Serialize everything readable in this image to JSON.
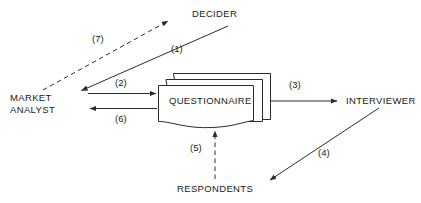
{
  "diagram": {
    "stroke_color": "#2b2b2b",
    "text_color": "#1a1a1a",
    "background_color": "#ffffff",
    "nodes": {
      "decider": {
        "label": "DECIDER"
      },
      "market_analyst": {
        "label": "MARKET\nANALYST",
        "line1": "MARKET",
        "line2": "ANALYST"
      },
      "questionnaire": {
        "label": "QUESTIONNAIRE"
      },
      "interviewer": {
        "label": "INTERVIEWER"
      },
      "respondents": {
        "label": "RESPONDENTS"
      }
    },
    "edges": [
      {
        "id": "1",
        "label": "(1)",
        "from": "decider",
        "to": "market_analyst",
        "style": "solid",
        "direction": "down-left"
      },
      {
        "id": "2",
        "label": "(2)",
        "from": "market_analyst",
        "to": "questionnaire",
        "style": "solid",
        "direction": "right"
      },
      {
        "id": "3",
        "label": "(3)",
        "from": "questionnaire",
        "to": "interviewer",
        "style": "solid",
        "direction": "right"
      },
      {
        "id": "4",
        "label": "(4)",
        "from": "interviewer",
        "to": "respondents",
        "style": "solid",
        "direction": "down-left"
      },
      {
        "id": "5",
        "label": "(5)",
        "from": "respondents",
        "to": "questionnaire",
        "style": "dashed",
        "direction": "up"
      },
      {
        "id": "6",
        "label": "(6)",
        "from": "questionnaire",
        "to": "market_analyst",
        "style": "solid",
        "direction": "left"
      },
      {
        "id": "7",
        "label": "(7)",
        "from": "market_analyst",
        "to": "decider",
        "style": "dashed",
        "direction": "up-right"
      }
    ]
  }
}
